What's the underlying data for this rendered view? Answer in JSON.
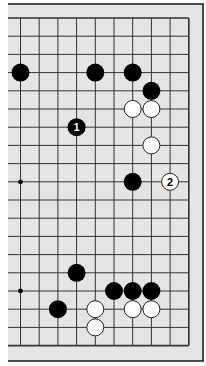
{
  "diagram": {
    "type": "go-board-diagram",
    "colors": {
      "board_background": "#e4e4e4",
      "grid_line": "#333333",
      "frame_border": "#4a4a4a",
      "black_stone": "#000000",
      "white_stone": "#ffffff",
      "white_stone_outline": "#222222"
    },
    "grid": {
      "columns": 10,
      "rows": 19,
      "x_positions": [
        20.5,
        39.2,
        57.9,
        76.6,
        95.3,
        114,
        132.7,
        151.4,
        170.1,
        188.8
      ],
      "y_positions": [
        18,
        36.2,
        54.4,
        72.6,
        90.8,
        109,
        127.2,
        145.4,
        163.6,
        181.8,
        200,
        218.2,
        236.4,
        254.6,
        272.8,
        291,
        309.2,
        327.4,
        345.6
      ],
      "left_edge_x": 8,
      "open_edges": [
        "left"
      ]
    },
    "hoshi": [
      {
        "col": 0,
        "row": 9
      },
      {
        "col": 0,
        "row": 15
      }
    ],
    "stones": [
      {
        "col": 0,
        "row": 3,
        "color": "black"
      },
      {
        "col": 4,
        "row": 3,
        "color": "black"
      },
      {
        "col": 6,
        "row": 3,
        "color": "black"
      },
      {
        "col": 7,
        "row": 4,
        "color": "black"
      },
      {
        "col": 6,
        "row": 5,
        "color": "white"
      },
      {
        "col": 7,
        "row": 5,
        "color": "white"
      },
      {
        "col": 3,
        "row": 6,
        "color": "black",
        "label": "1"
      },
      {
        "col": 7,
        "row": 7,
        "color": "white"
      },
      {
        "col": 6,
        "row": 9,
        "color": "black"
      },
      {
        "col": 8,
        "row": 9,
        "color": "white",
        "label": "2"
      },
      {
        "col": 3,
        "row": 14,
        "color": "black"
      },
      {
        "col": 5,
        "row": 15,
        "color": "black"
      },
      {
        "col": 6,
        "row": 15,
        "color": "black"
      },
      {
        "col": 7,
        "row": 15,
        "color": "black"
      },
      {
        "col": 2,
        "row": 16,
        "color": "black"
      },
      {
        "col": 4,
        "row": 16,
        "color": "white"
      },
      {
        "col": 6,
        "row": 16,
        "color": "white"
      },
      {
        "col": 7,
        "row": 16,
        "color": "white"
      },
      {
        "col": 4,
        "row": 17,
        "color": "white"
      }
    ]
  }
}
